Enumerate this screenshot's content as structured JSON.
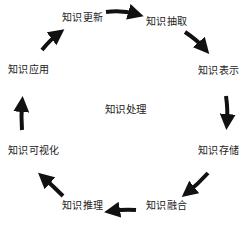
{
  "diagram": {
    "type": "cycle",
    "center": "知识处理",
    "nodes": [
      {
        "id": "update",
        "label": "知识更新"
      },
      {
        "id": "extract",
        "label": "知识抽取"
      },
      {
        "id": "represent",
        "label": "知识表示"
      },
      {
        "id": "store",
        "label": "知识存储"
      },
      {
        "id": "fuse",
        "label": "知识融合"
      },
      {
        "id": "reason",
        "label": "知识推理"
      },
      {
        "id": "visualize",
        "label": "知识可视化"
      },
      {
        "id": "apply",
        "label": "知识应用"
      }
    ],
    "edges": [
      {
        "from": "知识更新",
        "to": "知识抽取"
      },
      {
        "from": "知识抽取",
        "to": "知识表示"
      },
      {
        "from": "知识表示",
        "to": "知识存储"
      },
      {
        "from": "知识存储",
        "to": "知识融合"
      },
      {
        "from": "知识融合",
        "to": "知识推理"
      },
      {
        "from": "知识推理",
        "to": "知识可视化"
      },
      {
        "from": "知识可视化",
        "to": "知识应用"
      },
      {
        "from": "知识应用",
        "to": "知识更新"
      }
    ],
    "arrow_color": "#111111"
  }
}
